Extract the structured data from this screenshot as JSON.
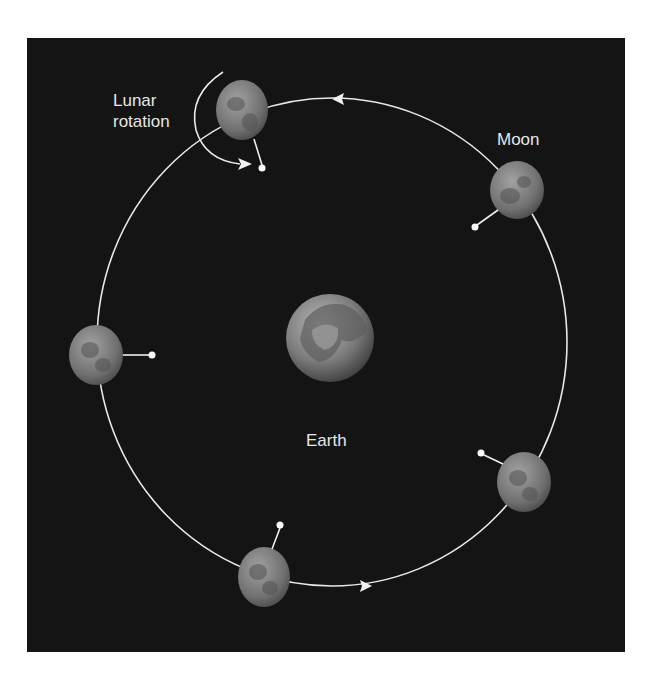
{
  "diagram": {
    "labels": {
      "lunar_rotation_line1": "Lunar",
      "lunar_rotation_line2": "rotation",
      "moon": "Moon",
      "earth": "Earth"
    },
    "orbit": {
      "cx": 332,
      "cy": 342,
      "rx": 235,
      "ry": 244,
      "direction": "counterclockwise"
    },
    "earth": {
      "cx": 330,
      "cy": 338,
      "r": 44
    },
    "moons": [
      {
        "cx": 242,
        "cy": 110,
        "rx": 26,
        "ry": 30,
        "marker": [
          262,
          168
        ]
      },
      {
        "cx": 517,
        "cy": 190,
        "rx": 27,
        "ry": 29,
        "marker": [
          475,
          227
        ]
      },
      {
        "cx": 96,
        "cy": 355,
        "rx": 27,
        "ry": 30,
        "marker": [
          152,
          355
        ]
      },
      {
        "cx": 524,
        "cy": 482,
        "rx": 27,
        "ry": 30,
        "marker": [
          481,
          453
        ]
      },
      {
        "cx": 264,
        "cy": 577,
        "rx": 26,
        "ry": 30,
        "marker": [
          280,
          525
        ]
      }
    ],
    "colors": {
      "background": "#141414",
      "line": "#e8e8e8",
      "moon": "#7a7a7a",
      "earth": "#8a8a8a",
      "page": "#ffffff"
    }
  }
}
